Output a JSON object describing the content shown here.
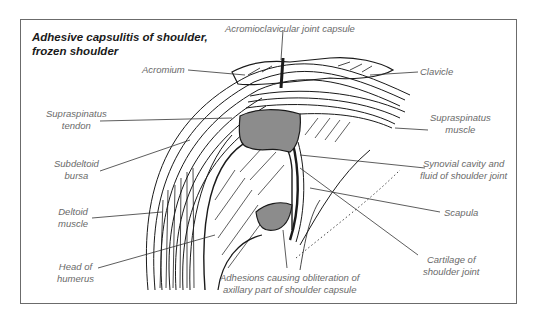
{
  "diagram": {
    "title_line1": "Adhesive capsulitis of shoulder,",
    "title_line2": "frozen shoulder",
    "colors": {
      "frame": "#6b6b6b",
      "ink": "#1a1a1a",
      "adhesion_fill": "#8c8c8c",
      "label_text": "#6a6a6a"
    },
    "labels": {
      "acromioclavicular": "Acromioclavicular joint capsule",
      "acromium": "Acromium",
      "clavicle": "Clavicle",
      "supraspinatus_tendon_1": "Supraspinatus",
      "supraspinatus_tendon_2": "tendon",
      "supraspinatus_muscle_1": "Supraspinatus",
      "supraspinatus_muscle_2": "muscle",
      "subdeltoid_1": "Subdeltoid",
      "subdeltoid_2": "bursa",
      "synovial_1": "Synovial cavity and",
      "synovial_2": "fluid of shoulder joint",
      "deltoid_1": "Deltoid",
      "deltoid_2": "muscle",
      "scapula": "Scapula",
      "head_1": "Head of",
      "head_2": "humerus",
      "cartilage_1": "Cartilage of",
      "cartilage_2": "shoulder joint",
      "adhesions_1": "Adhesions causing obliteration of",
      "adhesions_2": "axillary part of shoulder capsule"
    }
  }
}
